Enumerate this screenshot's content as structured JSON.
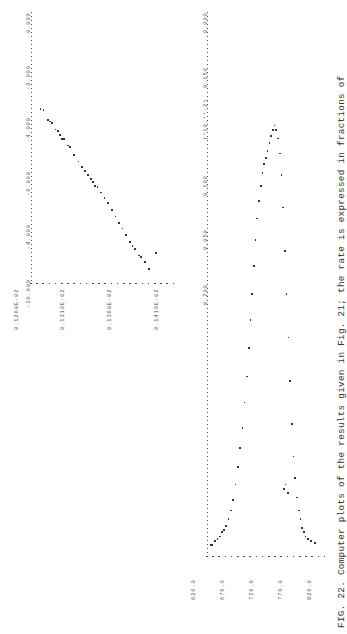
{
  "figure": {
    "caption": "FIG. 22.  Computer plots of the results given in Fig. 21; the rate is expressed in fractions of",
    "caption_label": "FIG. 22."
  },
  "chart_data": [
    {
      "id": "left-panel",
      "type": "scatter",
      "title": "",
      "orientation": "rotated-90",
      "xlabel": "",
      "ylabel": "",
      "x_unit_note": "(*10.**-2)",
      "x_ticks": [
        "0.000",
        "0.050",
        "0.100",
        "0.150",
        "0.200",
        "0.250"
      ],
      "xlim": [
        0.0,
        0.25
      ],
      "y_ticks": [
        "626.0",
        "676.0",
        "726.0",
        "776.0",
        "826.0"
      ],
      "ylim": [
        626.0,
        826.0
      ],
      "grid": false,
      "legend": "none",
      "points": [
        {
          "x": 0.004,
          "y": 631.0
        },
        {
          "x": 0.004,
          "y": 634.0
        },
        {
          "x": 0.006,
          "y": 639.0
        },
        {
          "x": 0.007,
          "y": 643.0
        },
        {
          "x": 0.008,
          "y": 647.0
        },
        {
          "x": 0.01,
          "y": 651.0
        },
        {
          "x": 0.011,
          "y": 654.0
        },
        {
          "x": 0.013,
          "y": 658.0
        },
        {
          "x": 0.016,
          "y": 662.0
        },
        {
          "x": 0.02,
          "y": 666.0
        },
        {
          "x": 0.025,
          "y": 670.0
        },
        {
          "x": 0.032,
          "y": 674.0
        },
        {
          "x": 0.04,
          "y": 678.0
        },
        {
          "x": 0.049,
          "y": 682.0
        },
        {
          "x": 0.058,
          "y": 686.0
        },
        {
          "x": 0.07,
          "y": 690.0
        },
        {
          "x": 0.082,
          "y": 694.0
        },
        {
          "x": 0.095,
          "y": 697.0
        },
        {
          "x": 0.108,
          "y": 700.0
        },
        {
          "x": 0.12,
          "y": 703.0
        },
        {
          "x": 0.133,
          "y": 706.0
        },
        {
          "x": 0.145,
          "y": 709.0
        },
        {
          "x": 0.155,
          "y": 712.0
        },
        {
          "x": 0.163,
          "y": 715.0
        },
        {
          "x": 0.17,
          "y": 718.0
        },
        {
          "x": 0.176,
          "y": 721.0
        },
        {
          "x": 0.18,
          "y": 724.0
        },
        {
          "x": 0.183,
          "y": 727.0
        },
        {
          "x": 0.186,
          "y": 730.0
        },
        {
          "x": 0.19,
          "y": 733.0
        },
        {
          "x": 0.193,
          "y": 736.0
        },
        {
          "x": 0.196,
          "y": 739.0
        },
        {
          "x": 0.198,
          "y": 742.0
        },
        {
          "x": 0.196,
          "y": 745.0
        },
        {
          "x": 0.192,
          "y": 748.0
        },
        {
          "x": 0.185,
          "y": 751.0
        },
        {
          "x": 0.175,
          "y": 754.0
        },
        {
          "x": 0.16,
          "y": 757.0
        },
        {
          "x": 0.14,
          "y": 760.0
        },
        {
          "x": 0.12,
          "y": 763.0
        },
        {
          "x": 0.1,
          "y": 766.0
        },
        {
          "x": 0.08,
          "y": 769.0
        },
        {
          "x": 0.06,
          "y": 772.0
        },
        {
          "x": 0.045,
          "y": 775.0
        },
        {
          "x": 0.035,
          "y": 778.0
        },
        {
          "x": 0.026,
          "y": 781.0
        },
        {
          "x": 0.02,
          "y": 784.0
        },
        {
          "x": 0.016,
          "y": 787.0
        },
        {
          "x": 0.012,
          "y": 790.0
        },
        {
          "x": 0.01,
          "y": 793.0
        },
        {
          "x": 0.008,
          "y": 796.0
        },
        {
          "x": 0.007,
          "y": 800.0
        },
        {
          "x": 0.006,
          "y": 805.0
        },
        {
          "x": 0.005,
          "y": 812.0
        },
        {
          "x": 0.03,
          "y": 758.0
        },
        {
          "x": 0.032,
          "y": 761.0
        },
        {
          "x": 0.028,
          "y": 765.0
        }
      ]
    },
    {
      "id": "right-panel",
      "type": "scatter",
      "title": "",
      "orientation": "rotated-90",
      "xlabel": "",
      "ylabel": "",
      "x_ticks": [
        "0.000",
        "-2.000",
        "-4.000",
        "-6.000",
        "-8.000",
        "-10.000"
      ],
      "xlim": [
        -10.0,
        0.0
      ],
      "y_ticks": [
        "0.1260E-02",
        "0.1310E-02",
        "0.1360E-02",
        "0.1410E-02",
        "0.1460E-02"
      ],
      "ylim": [
        0.00126,
        0.00146
      ],
      "grid": false,
      "legend": "none",
      "points": [
        {
          "x": -3.6,
          "y": 0.001272
        },
        {
          "x": -3.62,
          "y": 0.001276
        },
        {
          "x": -4.0,
          "y": 0.001282
        },
        {
          "x": -4.05,
          "y": 0.001285
        },
        {
          "x": -4.1,
          "y": 0.001288
        },
        {
          "x": -4.35,
          "y": 0.001293
        },
        {
          "x": -4.4,
          "y": 0.001296
        },
        {
          "x": -4.55,
          "y": 0.001299
        },
        {
          "x": -4.7,
          "y": 0.001302
        },
        {
          "x": -4.72,
          "y": 0.001305
        },
        {
          "x": -4.95,
          "y": 0.00131
        },
        {
          "x": -5.0,
          "y": 0.001313
        },
        {
          "x": -5.3,
          "y": 0.001319
        },
        {
          "x": -5.55,
          "y": 0.001325
        },
        {
          "x": -5.75,
          "y": 0.00133
        },
        {
          "x": -5.9,
          "y": 0.001334
        },
        {
          "x": -6.05,
          "y": 0.001338
        },
        {
          "x": -6.2,
          "y": 0.001342
        },
        {
          "x": -6.3,
          "y": 0.001345
        },
        {
          "x": -6.45,
          "y": 0.001348
        },
        {
          "x": -6.5,
          "y": 0.001351
        },
        {
          "x": -6.7,
          "y": 0.001356
        },
        {
          "x": -6.9,
          "y": 0.001361
        },
        {
          "x": -7.1,
          "y": 0.001366
        },
        {
          "x": -7.35,
          "y": 0.001371
        },
        {
          "x": -7.6,
          "y": 0.001376
        },
        {
          "x": -7.85,
          "y": 0.001381
        },
        {
          "x": -8.05,
          "y": 0.001386
        },
        {
          "x": -8.3,
          "y": 0.001391
        },
        {
          "x": -8.55,
          "y": 0.001396
        },
        {
          "x": -8.7,
          "y": 0.0014
        },
        {
          "x": -8.8,
          "y": 0.001403
        },
        {
          "x": -9.05,
          "y": 0.001409
        },
        {
          "x": -9.1,
          "y": 0.001412
        },
        {
          "x": -9.3,
          "y": 0.001417
        },
        {
          "x": -9.55,
          "y": 0.001423
        },
        {
          "x": -8.95,
          "y": 0.001432
        }
      ]
    }
  ]
}
